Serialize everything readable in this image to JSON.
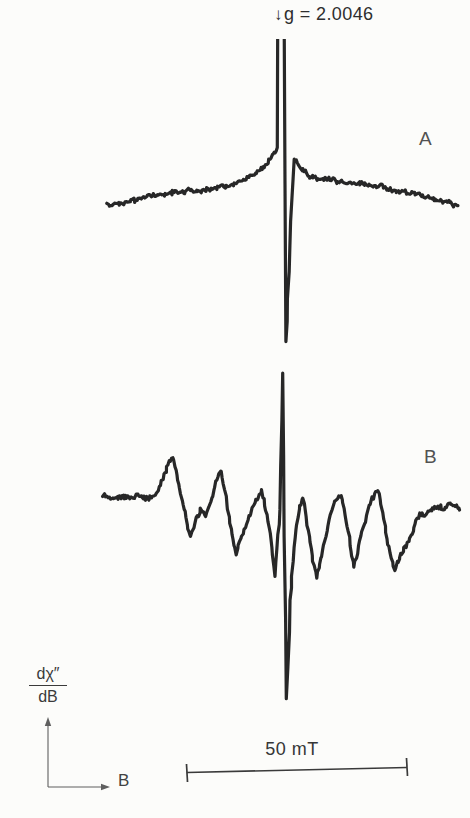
{
  "figure": {
    "marker": {
      "arrow": "↓",
      "label": "g = 2.0046"
    },
    "trace_labels": {
      "a": "A",
      "b": "B"
    },
    "scale_bar": {
      "label": "50 mT"
    },
    "y_axis": {
      "numerator": "dχ″",
      "denominator": "dB"
    },
    "x_axis": {
      "label": "B"
    }
  },
  "colors": {
    "trace": "#272727",
    "label": "#525252",
    "annotation": "#2e2e2e",
    "axis": "#5f5f5f",
    "scalebar": "#3a3a3a",
    "background": "#fcfcfa"
  },
  "chart_data": {
    "type": "line",
    "xlabel": "B",
    "ylabel": "dχ″/dB",
    "x_unit": "mT",
    "x_range_mT": [
      -41,
      40
    ],
    "grid": false,
    "marker": {
      "label": "g = 2.0046",
      "x_mT": 0
    },
    "scale_bar": {
      "label": "50 mT",
      "length_mT": 50
    },
    "series": [
      {
        "name": "A",
        "description": "Narrow central resonance on broad noisy baseline; central peak clipped at top",
        "points": [
          [
            -39.8,
            -5
          ],
          [
            -35.7,
            -3
          ],
          [
            -30.1,
            4
          ],
          [
            -24.4,
            8
          ],
          [
            -18.8,
            10
          ],
          [
            -13.1,
            14
          ],
          [
            -8.6,
            20
          ],
          [
            -5.7,
            28
          ],
          [
            -3.4,
            38
          ],
          [
            -2.0,
            46
          ],
          [
            -1.4,
            51
          ],
          [
            -1.2,
            175
          ],
          [
            0.2,
            175
          ],
          [
            0.6,
            -141
          ],
          [
            1.1,
            -100
          ],
          [
            1.8,
            -20
          ],
          [
            2.5,
            41
          ],
          [
            3.2,
            37
          ],
          [
            4.3,
            30
          ],
          [
            6.1,
            24
          ],
          [
            9.5,
            21
          ],
          [
            14.0,
            18
          ],
          [
            18.6,
            16
          ],
          [
            23.1,
            12
          ],
          [
            27.6,
            8
          ],
          [
            32.1,
            3
          ],
          [
            36.0,
            -1
          ],
          [
            39.6,
            -6
          ]
        ]
      },
      {
        "name": "B",
        "description": "Six-line hyperfine derivative pattern with sharp central spike",
        "points": [
          [
            -40.7,
            24
          ],
          [
            -38.0,
            22
          ],
          [
            -35.1,
            23
          ],
          [
            -32.4,
            23
          ],
          [
            -29.6,
            22
          ],
          [
            -28.3,
            30
          ],
          [
            -26.7,
            46
          ],
          [
            -25.6,
            60
          ],
          [
            -24.9,
            64
          ],
          [
            -23.8,
            42
          ],
          [
            -22.4,
            12
          ],
          [
            -21.5,
            -10
          ],
          [
            -20.8,
            -15
          ],
          [
            -19.7,
            0
          ],
          [
            -18.6,
            9
          ],
          [
            -17.4,
            5
          ],
          [
            -16.1,
            20
          ],
          [
            -14.9,
            40
          ],
          [
            -14.0,
            50
          ],
          [
            -12.7,
            15
          ],
          [
            -11.5,
            -15
          ],
          [
            -10.6,
            -33
          ],
          [
            -9.3,
            -15
          ],
          [
            -7.7,
            4
          ],
          [
            -6.1,
            18
          ],
          [
            -4.8,
            29
          ],
          [
            -3.6,
            5
          ],
          [
            -2.5,
            -28
          ],
          [
            -1.8,
            -55
          ],
          [
            -0.7,
            8
          ],
          [
            -0.1,
            146
          ],
          [
            0.8,
            -180
          ],
          [
            1.6,
            -80
          ],
          [
            2.7,
            -15
          ],
          [
            3.6,
            10
          ],
          [
            4.6,
            23
          ],
          [
            5.7,
            -10
          ],
          [
            6.8,
            -40
          ],
          [
            7.7,
            -56
          ],
          [
            8.8,
            -35
          ],
          [
            10.2,
            -5
          ],
          [
            11.5,
            15
          ],
          [
            13.1,
            26
          ],
          [
            14.3,
            0
          ],
          [
            15.2,
            -25
          ],
          [
            16.1,
            -46
          ],
          [
            17.2,
            -25
          ],
          [
            18.6,
            0
          ],
          [
            19.9,
            20
          ],
          [
            21.5,
            31
          ],
          [
            22.6,
            5
          ],
          [
            23.8,
            -25
          ],
          [
            25.3,
            -50
          ],
          [
            26.5,
            -36
          ],
          [
            27.6,
            -28
          ],
          [
            28.7,
            -18
          ],
          [
            29.9,
            -4
          ],
          [
            31.0,
            5
          ],
          [
            32.8,
            8
          ],
          [
            34.6,
            11
          ],
          [
            36.7,
            14
          ],
          [
            38.5,
            15
          ],
          [
            40.0,
            13
          ]
        ]
      }
    ]
  },
  "render": {
    "center_px": 283,
    "px_per_mT": 4.42,
    "sample_step_px": 1.2,
    "stroke_px": 3.2,
    "series": [
      {
        "baseline_px": 200,
        "noise_px": 2.6,
        "clip_top_px": 39
      },
      {
        "baseline_px": 520,
        "noise_px": 2.8,
        "clip_top_px": 0
      }
    ]
  }
}
